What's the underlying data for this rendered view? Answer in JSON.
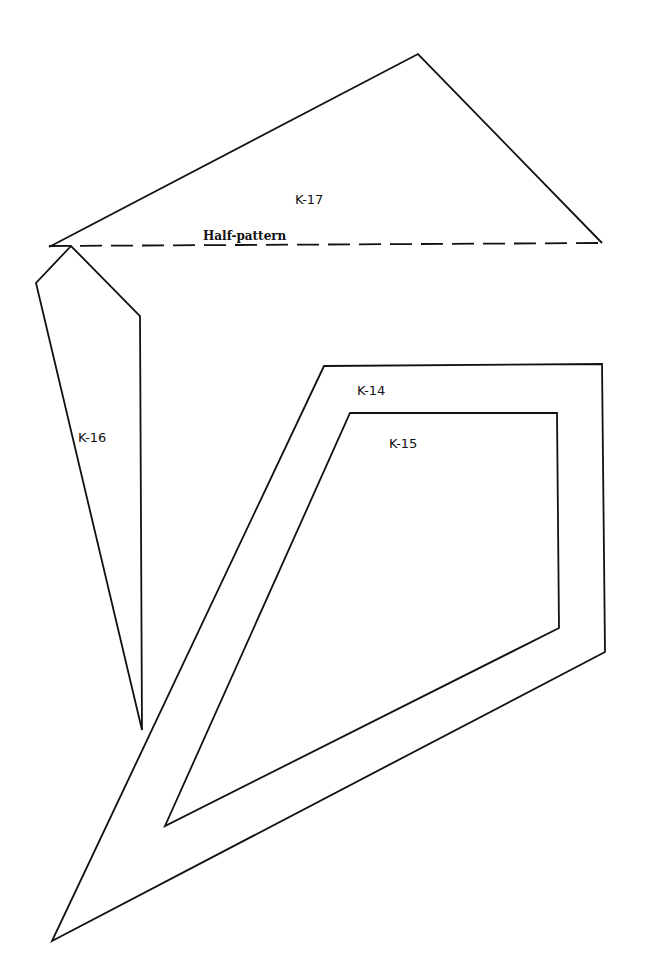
{
  "pieces": [
    {
      "id": "K-17",
      "label": "K-17",
      "points": "49,247 418,54 602,243",
      "fold_line": {
        "x1": 49,
        "y1": 246,
        "x2": 602,
        "y2": 243,
        "label": "Half-pattern"
      }
    },
    {
      "id": "K-16",
      "label": "K-16",
      "points": "71,246 36,283 142,730 140,316"
    },
    {
      "id": "K-14",
      "label": "K-14",
      "points": "324,366 602,364 605,652 52,941"
    },
    {
      "id": "K-15",
      "label": "K-15",
      "points": "350,413 557,413 559,628 165,826"
    }
  ],
  "labels": {
    "k17": "K-17",
    "half_pattern": "Half-pattern",
    "k16": "K-16",
    "k14": "K-14",
    "k15": "K-15"
  }
}
